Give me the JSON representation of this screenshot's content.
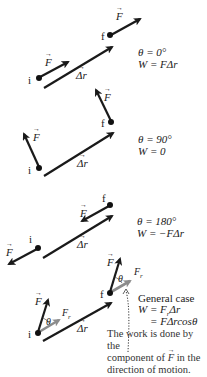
{
  "panels": [
    {
      "id": "theta-0",
      "theta_label": "θ = 0°",
      "work_label": "W = FΔr",
      "theta_deg": 0
    },
    {
      "id": "theta-90",
      "theta_label": "θ = 90°",
      "work_label": "W = 0",
      "theta_deg": 90
    },
    {
      "id": "theta-180",
      "theta_label": "θ = 180°",
      "work_label": "W = −FΔr",
      "theta_deg": 180
    },
    {
      "id": "general",
      "title": "General case",
      "work_line1": "W = F",
      "work_line1_sub": "r",
      "work_line1_tail": "Δr",
      "work_line2": "= FΔrcosθ"
    }
  ],
  "labels": {
    "initial": "i",
    "final": "f",
    "force": "F",
    "displacement": "Δr",
    "theta": "θ",
    "component": "F",
    "component_sub": "r"
  },
  "note": {
    "line1": "The work is done by the",
    "line2_pre": "component of ",
    "line2_vec": "F",
    "line2_post": " in the",
    "line3": "direction of motion."
  },
  "colors": {
    "vector": "#1a1a1a",
    "component": "#8c8c8c",
    "text": "#222222"
  }
}
